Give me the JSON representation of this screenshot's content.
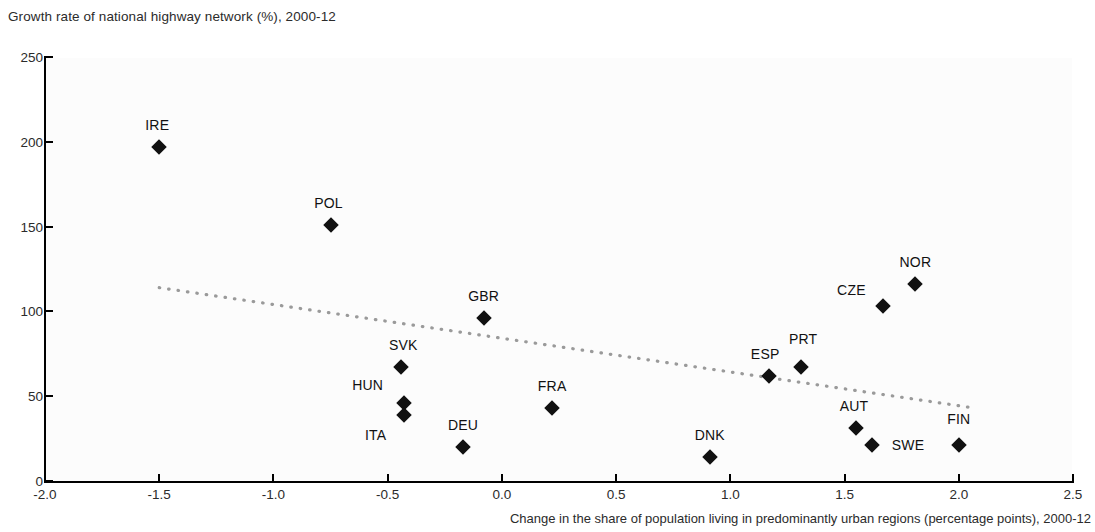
{
  "chart_data": {
    "type": "scatter",
    "title": "Growth rate of national highway network (%), 2000-12",
    "xlabel": "Change in the share of population living in predominantly urban regions (percentage points), 2000-12",
    "ylabel": "Growth rate of national highway network (%), 2000-12",
    "xlim": [
      -2.0,
      2.5
    ],
    "ylim": [
      0,
      250
    ],
    "xticks": [
      "-2.0",
      "-1.5",
      "-1.0",
      "-0.5",
      "0.0",
      "0.5",
      "1.0",
      "1.5",
      "2.0",
      "2.5"
    ],
    "xtick_values": [
      -2.0,
      -1.5,
      -1.0,
      -0.5,
      0.0,
      0.5,
      1.0,
      1.5,
      2.0,
      2.5
    ],
    "yticks": [
      "0",
      "50",
      "100",
      "150",
      "200",
      "250"
    ],
    "ytick_values": [
      0,
      50,
      100,
      150,
      200,
      250
    ],
    "grid": false,
    "legend": "none",
    "points": [
      {
        "label": "IRE",
        "x": -1.5,
        "y": 197,
        "label_dx": -2,
        "label_dy": -30
      },
      {
        "label": "POL",
        "x": -0.75,
        "y": 151,
        "label_dx": -2,
        "label_dy": -30
      },
      {
        "label": "GBR",
        "x": -0.08,
        "y": 96,
        "label_dx": 0,
        "label_dy": -30
      },
      {
        "label": "SVK",
        "x": -0.44,
        "y": 67,
        "label_dx": 2,
        "label_dy": -30
      },
      {
        "label": "HUN",
        "x": -0.43,
        "y": 46,
        "label_dx": -36,
        "label_dy": -26
      },
      {
        "label": "ITA",
        "x": -0.43,
        "y": 39,
        "label_dx": -28,
        "label_dy": 12
      },
      {
        "label": "DEU",
        "x": -0.17,
        "y": 20,
        "label_dx": 0,
        "label_dy": -30
      },
      {
        "label": "FRA",
        "x": 0.22,
        "y": 43,
        "label_dx": 0,
        "label_dy": -30
      },
      {
        "label": "DNK",
        "x": 0.91,
        "y": 14,
        "label_dx": 0,
        "label_dy": -30
      },
      {
        "label": "ESP",
        "x": 1.17,
        "y": 62,
        "label_dx": -4,
        "label_dy": -30
      },
      {
        "label": "PRT",
        "x": 1.31,
        "y": 67,
        "label_dx": 2,
        "label_dy": -36
      },
      {
        "label": "AUT",
        "x": 1.55,
        "y": 31,
        "label_dx": -2,
        "label_dy": -30
      },
      {
        "label": "SWE",
        "x": 1.62,
        "y": 21,
        "label_dx": 36,
        "label_dy": -8
      },
      {
        "label": "CZE",
        "x": 1.67,
        "y": 103,
        "label_dx": -32,
        "label_dy": -24
      },
      {
        "label": "NOR",
        "x": 1.81,
        "y": 116,
        "label_dx": 0,
        "label_dy": -30
      },
      {
        "label": "FIN",
        "x": 2.0,
        "y": 21,
        "label_dx": 0,
        "label_dy": -34
      }
    ],
    "trendline": {
      "style": "dotted",
      "color": "#9a9a9a",
      "x0": -1.5,
      "y0": 114,
      "x1": 2.07,
      "y1": 43
    }
  },
  "colors": {
    "marker": "#111111",
    "axis": "#000000",
    "text": "#2b2b2b",
    "trend": "#9a9a9a"
  }
}
